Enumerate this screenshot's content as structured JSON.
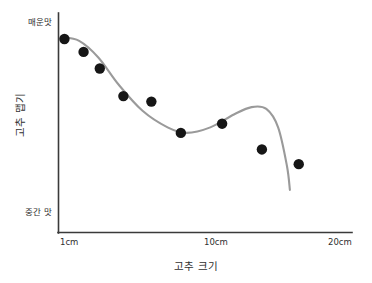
{
  "chart_data": {
    "type": "scatter",
    "title": "",
    "subtitle": "",
    "xlabel": "고추 크기",
    "ylabel": "고추 맵기",
    "grid": false,
    "legend": null,
    "xlim": [
      1,
      20
    ],
    "ylim": [
      0,
      10
    ],
    "x_tick_labels": [
      "1cm",
      "10cm",
      "20cm"
    ],
    "x_tick_values": [
      1,
      10,
      20
    ],
    "y_tick_labels": [
      "매운맛",
      "중간 맛"
    ],
    "y_tick_values": [
      10,
      0
    ],
    "y_axis_top_label": "매운맛",
    "y_axis_bottom_label": "중간 맛",
    "series": [
      {
        "name": "고추 맵기 관측값",
        "type": "scatter",
        "marker": "filled-circle",
        "color": "#161616",
        "points": [
          {
            "x": 1.3,
            "y": 9.4
          },
          {
            "x": 2.6,
            "y": 8.7
          },
          {
            "x": 3.7,
            "y": 7.8
          },
          {
            "x": 5.3,
            "y": 6.3
          },
          {
            "x": 7.2,
            "y": 6.0
          },
          {
            "x": 9.2,
            "y": 4.3
          },
          {
            "x": 12.0,
            "y": 4.8
          },
          {
            "x": 14.7,
            "y": 3.4
          },
          {
            "x": 17.2,
            "y": 2.6
          }
        ]
      },
      {
        "name": "추세선",
        "type": "line",
        "color": "#9a9a9a",
        "points": [
          {
            "x": 1.1,
            "y": 9.5
          },
          {
            "x": 2.3,
            "y": 9.3
          },
          {
            "x": 3.6,
            "y": 8.4
          },
          {
            "x": 5.0,
            "y": 6.9
          },
          {
            "x": 6.6,
            "y": 5.5
          },
          {
            "x": 8.3,
            "y": 4.6
          },
          {
            "x": 9.6,
            "y": 4.3
          },
          {
            "x": 11.2,
            "y": 4.6
          },
          {
            "x": 12.8,
            "y": 5.3
          },
          {
            "x": 14.0,
            "y": 5.7
          },
          {
            "x": 15.0,
            "y": 5.6
          },
          {
            "x": 15.8,
            "y": 4.6
          },
          {
            "x": 16.4,
            "y": 2.5
          },
          {
            "x": 16.6,
            "y": 1.2
          }
        ]
      }
    ],
    "colors": {
      "dot": "#161616",
      "curve": "#9a9a9a",
      "axis": "#3a3a3a",
      "text": "#2f2f2f",
      "background": "#ffffff"
    }
  }
}
